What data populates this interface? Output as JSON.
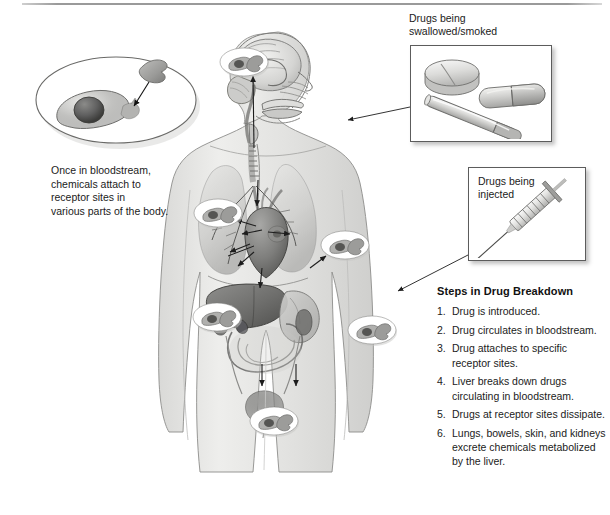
{
  "figure": {
    "kind": "medical-illustration",
    "title_visible": false,
    "background_color": "#ffffff",
    "ink_color": "#1b1b1b"
  },
  "cell_inset": {
    "name": "receptor-cell-detail",
    "caption": "Once in bloodstream,\nchemicals attach to\nreceptor sites in\nvarious parts of the body."
  },
  "panels": [
    {
      "id": "swallowed-smoked",
      "label": "Drugs being\nswallowed/smoked",
      "contents": [
        "pill-tablet",
        "capsule",
        "cigarette"
      ]
    },
    {
      "id": "injected",
      "label": "Drugs being\ninjected",
      "contents": [
        "syringe"
      ]
    }
  ],
  "steps": {
    "title": "Steps in Drug Breakdown",
    "items": [
      "Drug is introduced.",
      "Drug circulates in bloodstream.",
      "Drug attaches to specific receptor sites.",
      "Liver breaks down drugs circulating in bloodstream.",
      "Drugs at receptor sites dissipate.",
      "Lungs, bowels, skin, and kidneys excrete chemicals metabolized by the liver."
    ]
  },
  "receptor_markers": [
    {
      "id": "brain",
      "region": "head / brain"
    },
    {
      "id": "lung-left",
      "region": "left lung"
    },
    {
      "id": "heart",
      "region": "heart"
    },
    {
      "id": "liver",
      "region": "liver / right abdomen"
    },
    {
      "id": "intestine",
      "region": "left abdomen"
    },
    {
      "id": "bladder",
      "region": "bladder / pelvis"
    }
  ],
  "anatomy": {
    "subject": "human-body-cutaway",
    "organs": [
      "brain",
      "nasal cavity",
      "mouth",
      "trachea",
      "lungs",
      "heart",
      "liver",
      "stomach",
      "intestines",
      "kidneys",
      "ureters",
      "bladder"
    ]
  }
}
